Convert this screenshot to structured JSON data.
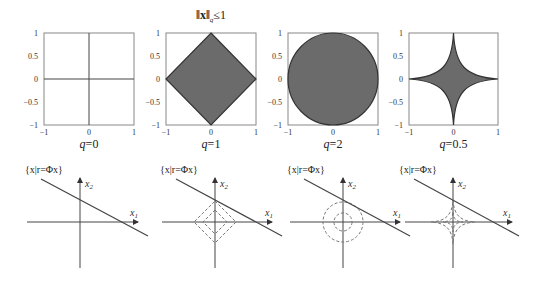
{
  "title_parts": {
    "norm": "‖x‖",
    "sub": "q",
    "rel": "≤1"
  },
  "top_row": [
    {
      "label": "q=0",
      "q_sym": "q",
      "q_val": "=0",
      "shape": "axes-cross"
    },
    {
      "label": "q=1",
      "q_sym": "q",
      "q_val": "=1",
      "shape": "diamond"
    },
    {
      "label": "q=2",
      "q_sym": "q",
      "q_val": "=2",
      "shape": "circle"
    },
    {
      "label": "q=0.5",
      "q_sym": "q",
      "q_val": "=0.5",
      "shape": "astroid"
    }
  ],
  "ticks": {
    "x": [
      "−1",
      "0",
      "1"
    ],
    "y": [
      "1",
      "0.5",
      "0",
      "−0.5",
      "−1"
    ]
  },
  "bottom_row": [
    {
      "set_label": "{x|r=Φx}",
      "x1": "x",
      "x1_sub": "1",
      "x2": "x",
      "x2_sub": "2",
      "contours": "none"
    },
    {
      "set_label": "{x|r=Φx}",
      "x1": "x",
      "x1_sub": "1",
      "x2": "x",
      "x2_sub": "2",
      "contours": "dashed-diamonds"
    },
    {
      "set_label": "{x|r=Φx}",
      "x1": "x",
      "x1_sub": "1",
      "x2": "x",
      "x2_sub": "2",
      "contours": "dashed-circles"
    },
    {
      "set_label": "{x|r=Φx}",
      "x1": "x",
      "x1_sub": "1",
      "x2": "x",
      "x2_sub": "2",
      "contours": "dashed-astroids"
    }
  ],
  "colors": {
    "fill": "#6b6b6b",
    "stroke": "#444444",
    "frame": "#888888",
    "dash": "#777777"
  }
}
